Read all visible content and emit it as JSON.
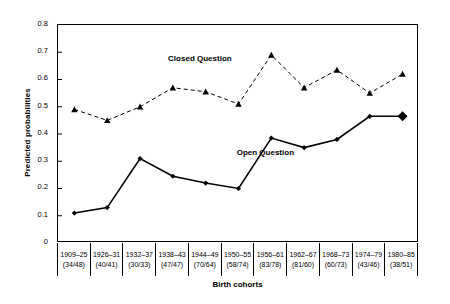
{
  "chart_data": {
    "type": "line",
    "title": "",
    "xlabel": "Birth cohorts",
    "ylabel": "Predicted probabilities",
    "ylim": [
      0,
      0.8
    ],
    "ytick_labels": [
      "0.8",
      "0.7",
      "0.6",
      "0.5",
      "0.4",
      "0.3",
      "0.2",
      "0.1",
      "0"
    ],
    "ytick_values": [
      0.8,
      0.7,
      0.6,
      0.5,
      0.4,
      0.3,
      0.2,
      0.1,
      0
    ],
    "grid": false,
    "legend_position": "inline-annotation",
    "categories": [
      "1909–25",
      "1926–31",
      "1932–37",
      "1938–43",
      "1944–49",
      "1950–55",
      "1956–61",
      "1962–67",
      "1968–73",
      "1974–79",
      "1980–85"
    ],
    "category_counts": [
      "(34/48)",
      "(40/41)",
      "(30/33)",
      "(47/47)",
      "(70/64)",
      "(58/74)",
      "(83/78)",
      "(81/60)",
      "(60/73)",
      "(43/46)",
      "(38/51)"
    ],
    "series": [
      {
        "name": "Closed Question",
        "style": "dashed",
        "marker": "triangle",
        "color": "#000000",
        "values": [
          0.49,
          0.45,
          0.5,
          0.57,
          0.555,
          0.51,
          0.69,
          0.57,
          0.635,
          0.55,
          0.62
        ]
      },
      {
        "name": "Open Question",
        "style": "solid",
        "marker": "diamond",
        "color": "#000000",
        "values": [
          0.11,
          0.13,
          0.31,
          0.245,
          0.22,
          0.2,
          0.385,
          0.35,
          0.38,
          0.465,
          0.465
        ]
      }
    ],
    "annotations": [
      {
        "text": "Closed Question",
        "x": 0.305,
        "y": 0.135
      },
      {
        "text": "Open Question",
        "x": 0.495,
        "y": 0.565
      }
    ]
  }
}
